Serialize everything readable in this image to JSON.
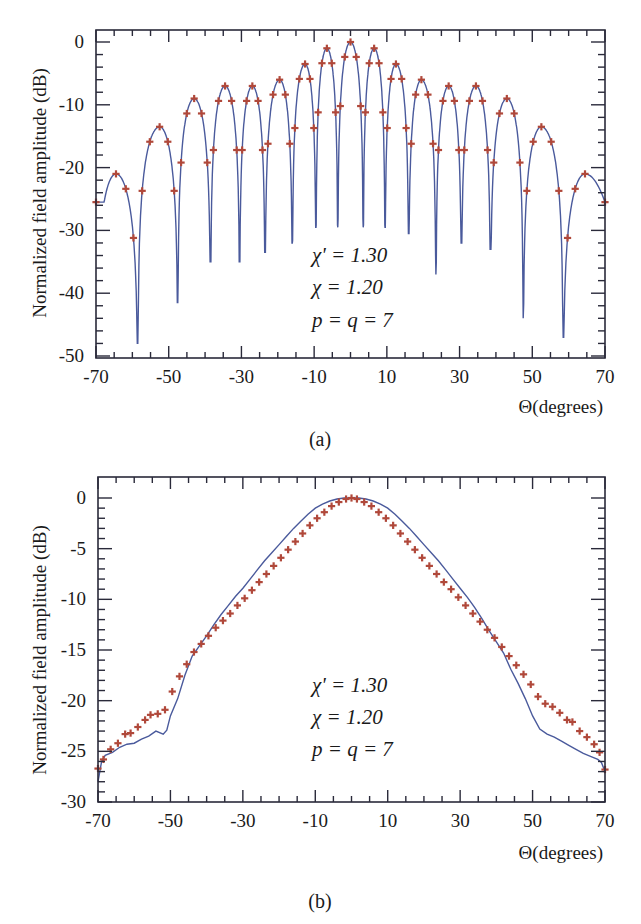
{
  "colors": {
    "curve": "#4a5a9c",
    "markers": "#b0483a",
    "axis": "#2a2a3a"
  },
  "chart_data": [
    {
      "id": "a",
      "type": "line",
      "caption": "(a)",
      "title": "",
      "xlabel": "Θ(degrees)",
      "ylabel": "Normalized field amplitude (dB)",
      "xlim": [
        -70,
        70
      ],
      "ylim": [
        -50,
        0
      ],
      "xticks": [
        -70,
        -50,
        -30,
        -10,
        10,
        30,
        50,
        70
      ],
      "x_minor_step": 5,
      "yticks": [
        0,
        -10,
        -20,
        -30,
        -40,
        -50
      ],
      "y_minor_step": 2,
      "grid": false,
      "legend": "none",
      "annotations": [
        "χ' = 1.30",
        "χ = 1.20",
        "p = q = 7"
      ],
      "series": [
        {
          "name": "Synthesized pattern (solid line)",
          "style": "line"
        },
        {
          "name": "Reference samples (+ markers)",
          "style": "markers"
        }
      ],
      "lobes": {
        "peaks": [
          {
            "x": -64.5,
            "y": -21
          },
          {
            "x": -52.5,
            "y": -13.5
          },
          {
            "x": -43,
            "y": -9
          },
          {
            "x": -34.5,
            "y": -7
          },
          {
            "x": -27,
            "y": -7
          },
          {
            "x": -19.5,
            "y": -6
          },
          {
            "x": -12.5,
            "y": -3.5
          },
          {
            "x": -6.5,
            "y": -1
          },
          {
            "x": 0,
            "y": 0
          },
          {
            "x": 6.5,
            "y": -1
          },
          {
            "x": 12.5,
            "y": -3.5
          },
          {
            "x": 19.5,
            "y": -6
          },
          {
            "x": 27,
            "y": -7
          },
          {
            "x": 34.5,
            "y": -7
          },
          {
            "x": 43,
            "y": -9
          },
          {
            "x": 52.5,
            "y": -13.5
          },
          {
            "x": 64.5,
            "y": -21
          }
        ],
        "nulls": [
          {
            "x": -58.5,
            "y": -48
          },
          {
            "x": -47.5,
            "y": -41.5
          },
          {
            "x": -38.5,
            "y": -35
          },
          {
            "x": -30.5,
            "y": -35
          },
          {
            "x": -23.5,
            "y": -33.5
          },
          {
            "x": -16,
            "y": -32
          },
          {
            "x": -9.5,
            "y": -29.5
          },
          {
            "x": -3.5,
            "y": -29.5
          },
          {
            "x": 3.5,
            "y": -29.5
          },
          {
            "x": 9.5,
            "y": -29.5
          },
          {
            "x": 16,
            "y": -30.5
          },
          {
            "x": 23.5,
            "y": -37
          },
          {
            "x": 30.5,
            "y": -32
          },
          {
            "x": 38.5,
            "y": -33
          },
          {
            "x": 47.5,
            "y": -44
          },
          {
            "x": 58.5,
            "y": -47
          }
        ],
        "edge_values": {
          "x_-70": -25.5,
          "x_70": -25.5
        }
      }
    },
    {
      "id": "b",
      "type": "line",
      "caption": "(b)",
      "title": "",
      "xlabel": "Θ(degrees)",
      "ylabel": "Normalized field amplitude (dB)",
      "xlim": [
        -70,
        70
      ],
      "ylim": [
        -30,
        0
      ],
      "xticks": [
        -70,
        -50,
        -30,
        -10,
        10,
        30,
        50,
        70
      ],
      "x_minor_step": 5,
      "yticks": [
        0,
        -5,
        -10,
        -15,
        -20,
        -25,
        -30
      ],
      "y_minor_step": 1,
      "grid": false,
      "legend": "none",
      "annotations": [
        "χ' = 1.30",
        "χ = 1.20",
        "p = q = 7"
      ],
      "series": [
        {
          "name": "Synthesized pattern (solid line)",
          "style": "line",
          "x": [
            -70,
            -69,
            -68,
            -66,
            -64,
            -62,
            -60,
            -58,
            -56,
            -54,
            -52,
            -51,
            -50,
            -48,
            -46,
            -44,
            -42,
            -40,
            -38,
            -36,
            -34,
            -32,
            -30,
            -28,
            -26,
            -24,
            -22,
            -20,
            -18,
            -16,
            -14,
            -12,
            -10,
            -8,
            -6,
            -4,
            -2,
            0,
            2,
            4,
            6,
            8,
            10,
            12,
            14,
            16,
            18,
            20,
            22,
            24,
            26,
            28,
            30,
            32,
            34,
            36,
            38,
            40,
            42,
            44,
            46,
            48,
            50,
            52,
            54,
            56,
            58,
            60,
            62,
            64,
            66,
            68,
            69,
            70
          ],
          "y": [
            -28,
            -26,
            -25.4,
            -25.1,
            -24.6,
            -24.3,
            -24.2,
            -23.8,
            -23.5,
            -23.0,
            -23.3,
            -22.9,
            -21.5,
            -19.8,
            -17.5,
            -15.6,
            -14.6,
            -13.6,
            -12.5,
            -11.5,
            -10.6,
            -9.7,
            -8.9,
            -8.0,
            -7.1,
            -6.2,
            -5.4,
            -4.6,
            -3.8,
            -3.0,
            -2.3,
            -1.6,
            -1.0,
            -0.6,
            -0.3,
            -0.1,
            0.0,
            0.0,
            0.0,
            -0.1,
            -0.3,
            -0.6,
            -1.0,
            -1.6,
            -2.3,
            -3.0,
            -3.8,
            -4.6,
            -5.4,
            -6.2,
            -7.1,
            -8.0,
            -8.9,
            -9.8,
            -10.8,
            -11.9,
            -13.1,
            -14.2,
            -15.3,
            -16.9,
            -18.3,
            -19.8,
            -21.5,
            -22.8,
            -23.3,
            -23.6,
            -24.0,
            -24.4,
            -24.8,
            -25.2,
            -25.5,
            -25.8,
            -26.1,
            -27
          ]
        },
        {
          "name": "Reference samples (+ markers)",
          "style": "markers",
          "x": [
            -70,
            -68.5,
            -66.5,
            -64.5,
            -62.5,
            -61,
            -59,
            -57,
            -55.5,
            -53.5,
            -51.5,
            -49.5,
            -47.5,
            -45.5,
            -43.5,
            -41.5,
            -39.5,
            -37.5,
            -35.5,
            -33.5,
            -31.5,
            -29.5,
            -27.5,
            -25.5,
            -23.5,
            -21.5,
            -19.5,
            -17.5,
            -15.5,
            -13.5,
            -11.5,
            -9.5,
            -7.5,
            -5.5,
            -3.5,
            -1.5,
            0,
            1.5,
            3.5,
            5.5,
            7.5,
            9.5,
            11.5,
            13.5,
            15.5,
            17.5,
            19.5,
            21.5,
            23.5,
            25.5,
            27.5,
            29.5,
            31.5,
            33.5,
            35.5,
            37.5,
            39.5,
            41.5,
            43.5,
            45.5,
            47.5,
            49.5,
            51.5,
            53.5,
            55.5,
            57.5,
            59.5,
            61,
            63,
            65,
            67,
            68.5,
            70
          ],
          "y": [
            -26.7,
            -25.8,
            -24.8,
            -24.2,
            -23.3,
            -23.2,
            -22.6,
            -21.9,
            -21.4,
            -21.3,
            -20.9,
            -19.1,
            -17.6,
            -16.4,
            -15.2,
            -14.4,
            -13.6,
            -12.8,
            -12.1,
            -11.4,
            -10.6,
            -9.9,
            -9.1,
            -8.3,
            -7.5,
            -6.7,
            -5.9,
            -5.1,
            -4.3,
            -3.5,
            -2.7,
            -2.0,
            -1.4,
            -0.8,
            -0.4,
            -0.1,
            0.0,
            -0.1,
            -0.4,
            -0.8,
            -1.4,
            -2.0,
            -2.7,
            -3.5,
            -4.3,
            -5.1,
            -5.9,
            -6.7,
            -7.5,
            -8.3,
            -9.0,
            -9.8,
            -10.6,
            -11.4,
            -12.2,
            -13.0,
            -13.8,
            -14.7,
            -15.6,
            -16.5,
            -17.4,
            -18.4,
            -19.6,
            -20.3,
            -20.6,
            -21.2,
            -21.9,
            -22.1,
            -23.0,
            -23.6,
            -24.3,
            -25.1,
            -26.8
          ]
        }
      ]
    }
  ]
}
